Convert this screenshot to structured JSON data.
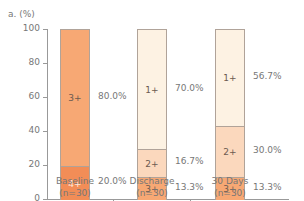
{
  "chart_data": {
    "type": "bar",
    "stacked": true,
    "panel_label": "a.",
    "ylabel": "(%)",
    "ylim": [
      0,
      100
    ],
    "yticks": [
      0,
      20,
      40,
      60,
      80,
      100
    ],
    "grid": false,
    "categories": [
      "Baseline",
      "Discharge",
      "30 Days"
    ],
    "category_n": [
      "(n=30)",
      "(n=30)",
      "(n=30)"
    ],
    "series": [
      {
        "name": "4+",
        "color": "#f28d57",
        "values": [
          20.0,
          0,
          0
        ]
      },
      {
        "name": "3+",
        "color": "#f7a874",
        "values": [
          80.0,
          13.3,
          13.3
        ]
      },
      {
        "name": "2+",
        "color": "#fbd8bd",
        "values": [
          0,
          16.7,
          30.0
        ]
      },
      {
        "name": "1+",
        "color": "#fdf2e3",
        "values": [
          0,
          70.0,
          56.7
        ]
      }
    ],
    "bars": [
      {
        "category": "Baseline",
        "segments": [
          {
            "grade": "4+",
            "value": 20.0,
            "label": "20.0%",
            "color": "#f28d57",
            "text_color": "#ffe9db"
          },
          {
            "grade": "3+",
            "value": 80.0,
            "label": "80.0%",
            "color": "#f7a874",
            "text_color": "#6b5b50"
          }
        ]
      },
      {
        "category": "Discharge",
        "segments": [
          {
            "grade": "3+",
            "value": 13.3,
            "label": "13.3%",
            "color": "#f7a874",
            "text_color": "#6b5b50"
          },
          {
            "grade": "2+",
            "value": 16.7,
            "label": "16.7%",
            "color": "#fbd8bd",
            "text_color": "#6b5b50"
          },
          {
            "grade": "1+",
            "value": 70.0,
            "label": "70.0%",
            "color": "#fdf2e3",
            "text_color": "#6b5b50"
          }
        ]
      },
      {
        "category": "30 Days",
        "segments": [
          {
            "grade": "3+",
            "value": 13.3,
            "label": "13.3%",
            "color": "#f7a874",
            "text_color": "#6b5b50"
          },
          {
            "grade": "2+",
            "value": 30.0,
            "label": "30.0%",
            "color": "#fbd8bd",
            "text_color": "#6b5b50"
          },
          {
            "grade": "1+",
            "value": 56.7,
            "label": "56.7%",
            "color": "#fdf2e3",
            "text_color": "#6b5b50"
          }
        ]
      }
    ]
  }
}
